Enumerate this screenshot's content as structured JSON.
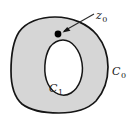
{
  "figure": {
    "kind": "math-diagram",
    "labels": {
      "point": {
        "symbol": "z",
        "subscript": "0",
        "full": "z0"
      },
      "outer_curve": {
        "symbol": "C",
        "subscript": "0",
        "full": "C0"
      },
      "inner_curve": {
        "symbol": "C",
        "subscript": "1",
        "full": "C1"
      }
    },
    "colors": {
      "region_fill": "#d6d6d6",
      "hole_fill": "#ffffff",
      "curve_stroke": "#151515",
      "point_fill": "#000000",
      "leader_stroke": "#2a2a2a",
      "background": "#ffffff"
    },
    "geometry": {
      "point_z0": {
        "x": 58,
        "y": 34,
        "r": 3.4
      },
      "leader_line": {
        "x1": 94,
        "y1": 14,
        "x2": 63,
        "y2": 31
      },
      "outer_curve_bbox": {
        "x": 11,
        "y": 17,
        "width": 97,
        "height": 96
      },
      "inner_curve_bbox": {
        "x": 45,
        "y": 40,
        "width": 38,
        "height": 56
      }
    }
  }
}
